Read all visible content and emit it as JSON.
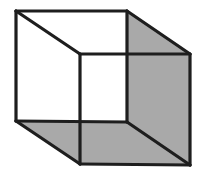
{
  "figure": {
    "title": "Shaded transparent cube (Necker cube)",
    "caption": "",
    "background_color": "#ffffff",
    "line_color": "#1e1e1e",
    "line_width": 3.2,
    "shade_color": "#a9a9a9",
    "open_face_color": "#ffffff",
    "style": "hand-drawn line art, scanned",
    "canvas": {
      "width": 206,
      "height": 180
    }
  },
  "geometry": {
    "description": "Wireframe cube in oblique projection; the back square is up-left and the front square is down-right. The right-hand side face and the bottom face are filled grey.",
    "vertices": {
      "back_top_left": [
        16,
        11
      ],
      "back_top_right": [
        127,
        11
      ],
      "back_bottom_right": [
        127,
        122
      ],
      "back_bottom_left": [
        16,
        121
      ],
      "front_top_left": [
        80,
        54
      ],
      "front_top_right": [
        190,
        54
      ],
      "front_bottom_right": [
        190,
        165
      ],
      "front_bottom_left": [
        80,
        164
      ]
    },
    "faces": [
      {
        "name": "back-face",
        "shaded": false,
        "points": "16,11 127,11 127,122 16,121"
      },
      {
        "name": "front-face",
        "shaded": false,
        "points": "80,54 190,54 190,165 80,164"
      },
      {
        "name": "right-side-face",
        "shaded": true,
        "points": "127,11 190,54 190,165 127,122"
      },
      {
        "name": "bottom-face",
        "shaded": true,
        "points": "16,121 127,122 190,165 80,164"
      },
      {
        "name": "top-face",
        "shaded": false,
        "points": "16,11 127,11 190,54 80,54"
      },
      {
        "name": "left-side-face",
        "shaded": false,
        "points": "16,11 80,54 80,164 16,121"
      }
    ],
    "edges": [
      {
        "name": "back-top-edge",
        "points": "16,11 127,11"
      },
      {
        "name": "back-right-edge",
        "points": "127,11 127,122"
      },
      {
        "name": "back-bottom-edge",
        "points": "16,121 127,122"
      },
      {
        "name": "back-left-edge",
        "points": "16,11 16,121"
      },
      {
        "name": "front-top-edge",
        "points": "80,54 190,54"
      },
      {
        "name": "front-right-edge",
        "points": "190,54 190,165"
      },
      {
        "name": "front-bottom-edge",
        "points": "80,164 190,165"
      },
      {
        "name": "front-left-edge",
        "points": "80,54 80,164"
      },
      {
        "name": "connector-top-left",
        "points": "16,11 80,54"
      },
      {
        "name": "connector-top-right",
        "points": "127,11 190,54"
      },
      {
        "name": "connector-bottom-left",
        "points": "16,121 80,164"
      },
      {
        "name": "connector-bottom-right",
        "points": "127,122 190,165"
      }
    ]
  }
}
